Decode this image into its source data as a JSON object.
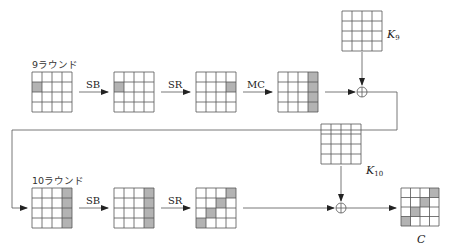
{
  "colors": {
    "line": "#555555",
    "shaded": "#b3b3b3",
    "background": "#ffffff"
  },
  "rounds": [
    {
      "label": "9ラウンド",
      "ops": [
        "SB",
        "SR",
        "MC"
      ],
      "states": [
        {
          "name": "input",
          "shaded": [
            [
              1,
              0
            ]
          ]
        },
        {
          "name": "after-SB",
          "shaded": [
            [
              1,
              0
            ]
          ]
        },
        {
          "name": "after-SR",
          "shaded": [
            [
              1,
              3
            ]
          ]
        },
        {
          "name": "after-MC",
          "shaded": [
            [
              0,
              3
            ],
            [
              1,
              3
            ],
            [
              2,
              3
            ],
            [
              3,
              3
            ]
          ]
        }
      ],
      "key": {
        "label": "K",
        "subscript": "9"
      }
    },
    {
      "label": "10ラウンド",
      "ops": [
        "SB",
        "SR"
      ],
      "states": [
        {
          "name": "input",
          "shaded": [
            [
              0,
              3
            ],
            [
              1,
              3
            ],
            [
              2,
              3
            ],
            [
              3,
              3
            ]
          ]
        },
        {
          "name": "after-SB",
          "shaded": [
            [
              0,
              3
            ],
            [
              1,
              3
            ],
            [
              2,
              3
            ],
            [
              3,
              3
            ]
          ]
        },
        {
          "name": "after-SR",
          "shaded": [
            [
              0,
              3
            ],
            [
              1,
              2
            ],
            [
              2,
              1
            ],
            [
              3,
              0
            ]
          ]
        }
      ],
      "key": {
        "label": "K",
        "subscript": "10"
      }
    }
  ],
  "output": {
    "label": "C",
    "shaded": [
      [
        0,
        3
      ],
      [
        1,
        2
      ],
      [
        2,
        1
      ],
      [
        3,
        0
      ]
    ]
  }
}
